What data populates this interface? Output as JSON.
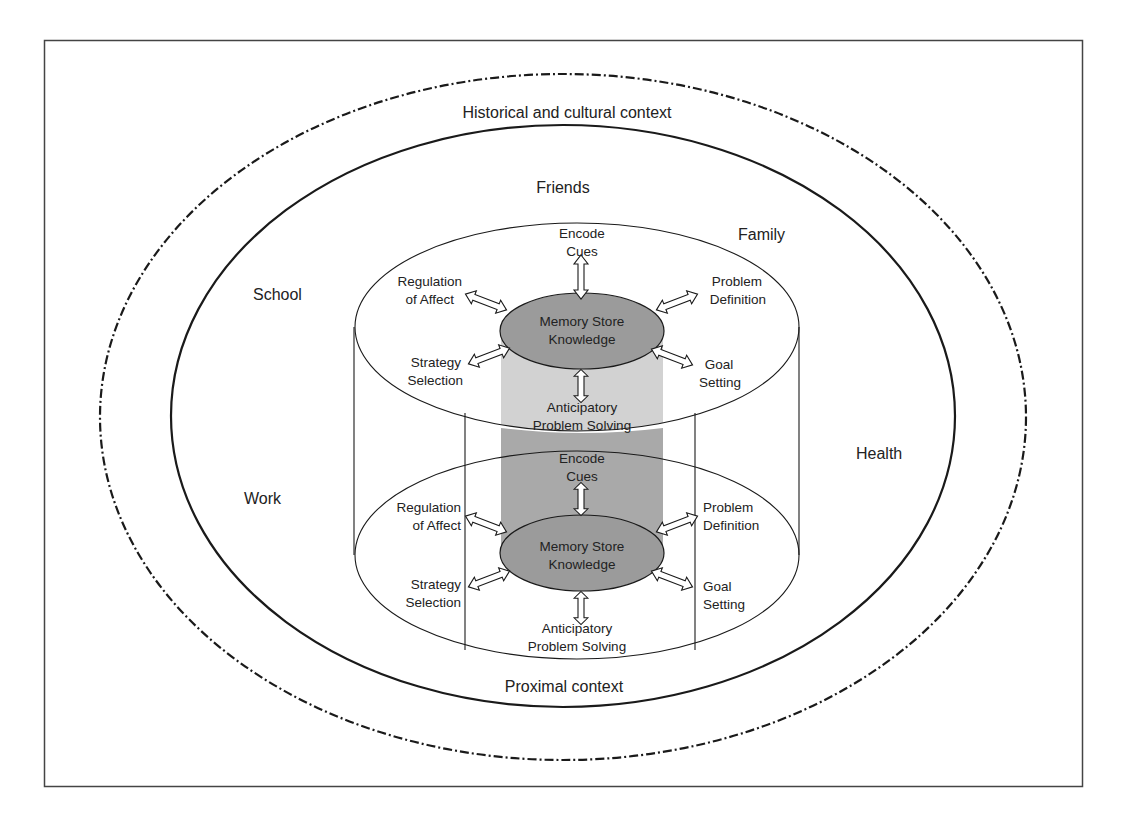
{
  "colors": {
    "line": "#1a1a1a",
    "border": "#444444",
    "column_light": "#d2d2d2",
    "column_dark": "#a9a9a9",
    "memory_fill": "#9b9b9b",
    "background": "#ffffff"
  },
  "outer_context": {
    "label": "Historical and cultural context"
  },
  "proximal_context": {
    "label": "Proximal context",
    "settings": {
      "friends": "Friends",
      "family": "Family",
      "school": "School",
      "work": "Work",
      "health": "Health"
    }
  },
  "cycles": [
    {
      "name": "upper",
      "center": {
        "line1": "Memory Store",
        "line2": "Knowledge"
      },
      "encode": {
        "line1": "Encode",
        "line2": "Cues"
      },
      "regulation": {
        "line1": "Regulation",
        "line2": "of Affect"
      },
      "problem_def": {
        "line1": "Problem",
        "line2": "Definition"
      },
      "strategy": {
        "line1": "Strategy",
        "line2": "Selection"
      },
      "goal": {
        "line1": "Goal",
        "line2": "Setting"
      },
      "anticipatory": {
        "line1": "Anticipatory",
        "line2": "Problem Solving"
      }
    },
    {
      "name": "lower",
      "center": {
        "line1": "Memory Store",
        "line2": "Knowledge"
      },
      "encode": {
        "line1": "Encode",
        "line2": "Cues"
      },
      "regulation": {
        "line1": "Regulation",
        "line2": "of Affect"
      },
      "problem_def": {
        "line1": "Problem",
        "line2": "Definition"
      },
      "strategy": {
        "line1": "Strategy",
        "line2": "Selection"
      },
      "goal": {
        "line1": "Goal",
        "line2": "Setting"
      },
      "anticipatory": {
        "line1": "Anticipatory",
        "line2": "Problem Solving"
      }
    }
  ]
}
